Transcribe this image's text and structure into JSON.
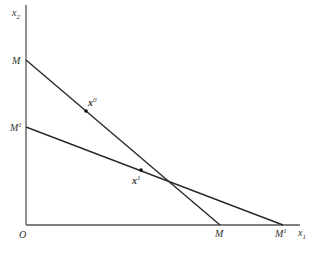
{
  "diagram": {
    "type": "budget-lines",
    "axes": {
      "x_label": "x",
      "x_sub": "1",
      "y_label": "x",
      "y_sub": "2",
      "origin_label": "O"
    },
    "lines": [
      {
        "name": "M",
        "y_intercept_label": "M",
        "x_intercept_label": "M"
      },
      {
        "name": "M1",
        "y_intercept_label": "M",
        "y_intercept_sup": "1",
        "x_intercept_label": "M",
        "x_intercept_sup": "1"
      }
    ],
    "points": [
      {
        "label": "x",
        "sup": "0"
      },
      {
        "label": "x",
        "sup": "1"
      }
    ],
    "colors": {
      "line": "#2a2a2a",
      "axis": "#555555",
      "text": "#333333"
    }
  }
}
